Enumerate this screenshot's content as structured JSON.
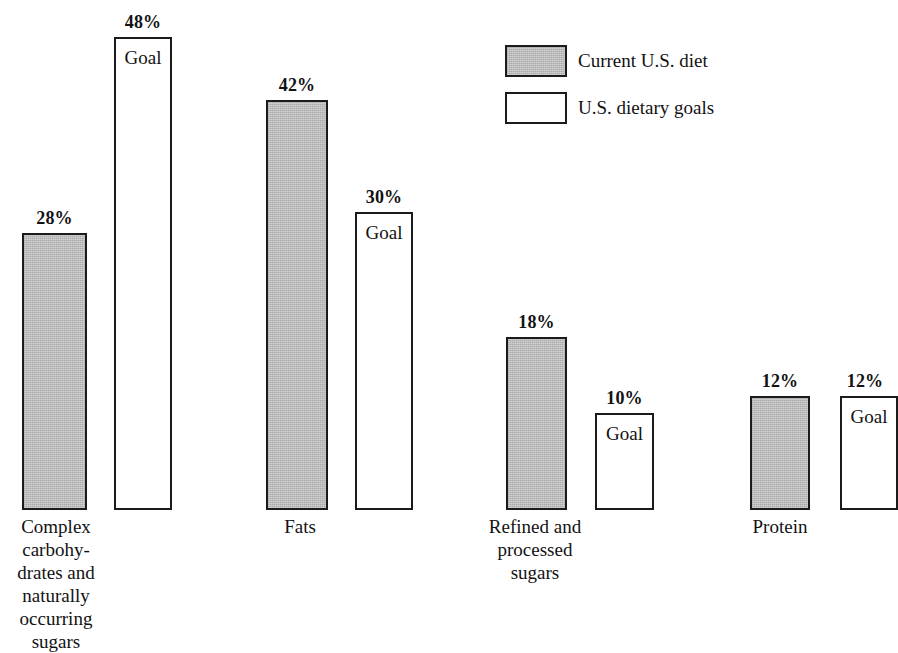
{
  "chart_data": {
    "type": "bar",
    "title": "",
    "subtitle": "",
    "xlabel": "",
    "ylabel": "",
    "ylim": [
      0,
      50
    ],
    "grid": false,
    "value_suffix": "%",
    "legend_position": "top-right",
    "goal_bar_caption": "Goal",
    "categories": [
      "Complex\ncarbohy-\ndrates and\nnaturally\noccurring\nsugars",
      "Fats",
      "Refined and\nprocessed\nsugars",
      "Protein"
    ],
    "series": [
      {
        "name": "Current U.S. diet",
        "fill": "#b4b4b4",
        "values": [
          28,
          42,
          18,
          12
        ],
        "labels": [
          "28%",
          "42%",
          "18%",
          "12%"
        ]
      },
      {
        "name": "U.S. dietary goals",
        "fill": "#ffffff",
        "values": [
          48,
          30,
          10,
          12
        ],
        "labels": [
          "48%",
          "30%",
          "10%",
          "12%"
        ]
      }
    ]
  },
  "legend": {
    "entries": [
      {
        "label": "Current U.S. diet",
        "swatch": "current"
      },
      {
        "label": "U.S. dietary goals",
        "swatch": "goal"
      }
    ]
  },
  "bars": [
    {
      "label": "28%",
      "goal_word": "",
      "kind": "current",
      "left": 22,
      "top": 233,
      "width": 65,
      "height": 277,
      "label_left": 22,
      "label_top": 209,
      "label_width": 65
    },
    {
      "label": "48%",
      "goal_word": "Goal",
      "kind": "goal",
      "left": 114,
      "top": 37,
      "width": 58,
      "height": 473,
      "label_left": 114,
      "label_top": 13,
      "label_width": 58,
      "goal_left": 114,
      "goal_top": 48,
      "goal_width": 58
    },
    {
      "label": "42%",
      "goal_word": "",
      "kind": "current",
      "left": 266,
      "top": 100,
      "width": 62,
      "height": 410,
      "label_left": 266,
      "label_top": 76,
      "label_width": 62
    },
    {
      "label": "30%",
      "goal_word": "Goal",
      "kind": "goal",
      "left": 355,
      "top": 212,
      "width": 58,
      "height": 298,
      "label_left": 355,
      "label_top": 188,
      "label_width": 58,
      "goal_left": 355,
      "goal_top": 223,
      "goal_width": 58
    },
    {
      "label": "18%",
      "goal_word": "",
      "kind": "current",
      "left": 506,
      "top": 337,
      "width": 61,
      "height": 173,
      "label_left": 506,
      "label_top": 313,
      "label_width": 61
    },
    {
      "label": "10%",
      "goal_word": "Goal",
      "kind": "goal",
      "left": 595,
      "top": 413,
      "width": 59,
      "height": 97,
      "label_left": 595,
      "label_top": 389,
      "label_width": 59,
      "goal_left": 595,
      "goal_top": 424,
      "goal_width": 59
    },
    {
      "label": "12%",
      "goal_word": "",
      "kind": "current",
      "left": 750,
      "top": 396,
      "width": 60,
      "height": 114,
      "label_left": 750,
      "label_top": 372,
      "label_width": 60
    },
    {
      "label": "12%",
      "goal_word": "Goal",
      "kind": "goal",
      "left": 840,
      "top": 396,
      "width": 58,
      "height": 114,
      "label_left": 836,
      "label_top": 372,
      "label_width": 58,
      "goal_left": 840,
      "goal_top": 407,
      "goal_width": 58
    }
  ],
  "category_labels": [
    {
      "text": "Complex\ncarbohy-\ndrates and\nnaturally\noccurring\nsugars",
      "left": -24,
      "top": 515,
      "width": 160
    },
    {
      "text": "Fats",
      "left": 240,
      "top": 515,
      "width": 120
    },
    {
      "text": "Refined and\nprocessed\nsugars",
      "left": 455,
      "top": 515,
      "width": 160
    },
    {
      "text": "Protein",
      "left": 720,
      "top": 515,
      "width": 120
    }
  ]
}
